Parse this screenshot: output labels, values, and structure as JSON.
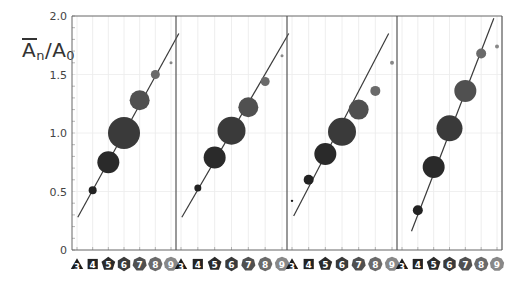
{
  "chart_data": {
    "type": "scatter",
    "title": "",
    "ylabel": "Ā_n / A_0",
    "xlabel": "",
    "ylim": [
      0,
      2.0
    ],
    "yticks": [
      "0",
      "0.5",
      "1.0",
      "1.5",
      "2.0"
    ],
    "categories": [
      "3",
      "4",
      "5",
      "6",
      "7",
      "8",
      "9"
    ],
    "category_shapes": [
      "triangle",
      "square",
      "pentagon",
      "hexagon",
      "heptagon",
      "octagon",
      "nonagon"
    ],
    "category_colors": [
      "#1a1a1a",
      "#222222",
      "#2a2a2a",
      "#3a3a3a",
      "#505050",
      "#6a6a6a",
      "#888888"
    ],
    "grid": true,
    "panels": [
      {
        "name": "panel-1",
        "points": [
          {
            "category": "4",
            "y": 0.51,
            "size": 4
          },
          {
            "category": "5",
            "y": 0.75,
            "size": 11
          },
          {
            "category": "6",
            "y": 1.0,
            "size": 16
          },
          {
            "category": "7",
            "y": 1.28,
            "size": 10
          },
          {
            "category": "8",
            "y": 1.5,
            "size": 4.5
          },
          {
            "category": "9",
            "y": 1.6,
            "size": 1.5
          }
        ],
        "fit_line": {
          "x0": 3.05,
          "y0": 0.28,
          "x1": 9.5,
          "y1": 1.85
        }
      },
      {
        "name": "panel-2",
        "points": [
          {
            "category": "4",
            "y": 0.53,
            "size": 3.5
          },
          {
            "category": "5",
            "y": 0.79,
            "size": 11
          },
          {
            "category": "6",
            "y": 1.02,
            "size": 14
          },
          {
            "category": "7",
            "y": 1.22,
            "size": 10
          },
          {
            "category": "8",
            "y": 1.44,
            "size": 4.5
          },
          {
            "category": "9",
            "y": 1.66,
            "size": 1.5
          }
        ],
        "fit_line": {
          "x0": 3.05,
          "y0": 0.28,
          "x1": 9.4,
          "y1": 1.85
        }
      },
      {
        "name": "panel-3",
        "points": [
          {
            "category": "3",
            "y": 0.42,
            "size": 1.2
          },
          {
            "category": "4",
            "y": 0.6,
            "size": 5
          },
          {
            "category": "5",
            "y": 0.82,
            "size": 11
          },
          {
            "category": "6",
            "y": 1.01,
            "size": 14
          },
          {
            "category": "7",
            "y": 1.2,
            "size": 10
          },
          {
            "category": "8",
            "y": 1.36,
            "size": 5
          },
          {
            "category": "9",
            "y": 1.6,
            "size": 2
          }
        ],
        "fit_line": {
          "x0": 3.1,
          "y0": 0.29,
          "x1": 8.8,
          "y1": 1.85
        }
      },
      {
        "name": "panel-4",
        "points": [
          {
            "category": "4",
            "y": 0.34,
            "size": 5
          },
          {
            "category": "5",
            "y": 0.71,
            "size": 11
          },
          {
            "category": "6",
            "y": 1.04,
            "size": 13
          },
          {
            "category": "7",
            "y": 1.36,
            "size": 11
          },
          {
            "category": "8",
            "y": 1.68,
            "size": 5
          },
          {
            "category": "9",
            "y": 1.74,
            "size": 2
          }
        ],
        "fit_line": {
          "x0": 3.6,
          "y0": 0.16,
          "x1": 8.8,
          "y1": 1.98
        }
      }
    ]
  },
  "axis": {
    "ylabel_main": "A",
    "ylabel_sub_n": "n",
    "ylabel_slash": "/A",
    "ylabel_sub_0": "0"
  }
}
